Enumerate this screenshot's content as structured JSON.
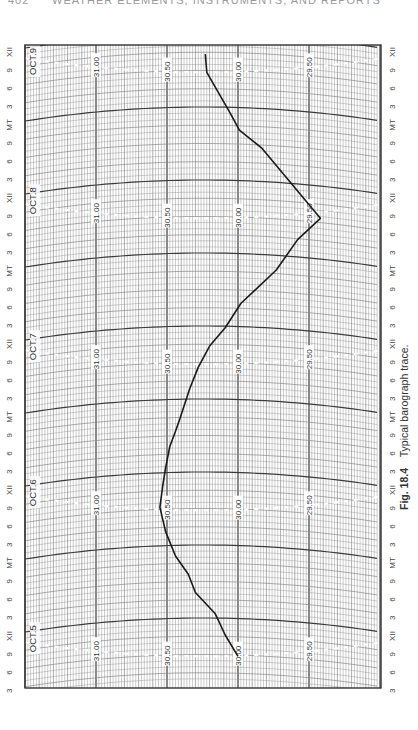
{
  "page": {
    "running_header": "WEATHER ELEMENTS, INSTRUMENTS, AND REPORTS",
    "page_number": "402"
  },
  "caption": {
    "figure": "Fig. 18.4",
    "text": "Typical barograph trace."
  },
  "chart_data": {
    "type": "line",
    "title": "Typical barograph trace",
    "orientation": "rotated 90° (time runs bottom-to-top, pressure decreases left-to-right)",
    "xlabel": "Time (3-hour ticks: 3, 6, 9, XII, 3, 6, 9, MT)",
    "ylabel": "Pressure (inches of mercury)",
    "pressure_ticks": [
      "31.00",
      "30.50",
      "30.00",
      "29.50"
    ],
    "pressure_range": [
      29.0,
      31.5
    ],
    "day_labels": [
      "OCT.5",
      "OCT.6",
      "OCT.7",
      "OCT.8",
      "OCT.9"
    ],
    "time_tick_labels_bottom_to_top": [
      "3",
      "6",
      "9",
      "XII",
      "3",
      "6",
      "9",
      "MT",
      "3",
      "6",
      "9",
      "XII",
      "3",
      "6",
      "9",
      "MT",
      "3",
      "6",
      "9",
      "XII",
      "3",
      "6",
      "9",
      "MT",
      "3",
      "6",
      "9",
      "XII",
      "3",
      "6",
      "9",
      "MT",
      "3",
      "6",
      "9",
      "XII"
    ],
    "grid": true,
    "series": [
      {
        "name": "Barometric pressure",
        "points": [
          {
            "time": "Oct 5 08:00",
            "value": 30.0
          },
          {
            "time": "Oct 5 11:30",
            "value": 30.09
          },
          {
            "time": "Oct 5 15:00",
            "value": 30.16
          },
          {
            "time": "Oct 5 18:30",
            "value": 30.3
          },
          {
            "time": "Oct 5 21:30",
            "value": 30.35
          },
          {
            "time": "Oct 6 00:30",
            "value": 30.44
          },
          {
            "time": "Oct 6 04:30",
            "value": 30.51
          },
          {
            "time": "Oct 6 08:30",
            "value": 30.55
          },
          {
            "time": "Oct 6 12:00",
            "value": 30.53
          },
          {
            "time": "Oct 6 15:00",
            "value": 30.51
          },
          {
            "time": "Oct 6 18:30",
            "value": 30.48
          },
          {
            "time": "Oct 6 21:00",
            "value": 30.44
          },
          {
            "time": "Oct 6 23:00",
            "value": 30.41
          },
          {
            "time": "Oct 7 04:00",
            "value": 30.34
          },
          {
            "time": "Oct 7 07:30",
            "value": 30.28
          },
          {
            "time": "Oct 7 11:00",
            "value": 30.2
          },
          {
            "time": "Oct 7 14:00",
            "value": 30.09
          },
          {
            "time": "Oct 7 18:00",
            "value": 29.98
          },
          {
            "time": "Oct 7 23:30",
            "value": 29.73
          },
          {
            "time": "Oct 8 04:30",
            "value": 29.58
          },
          {
            "time": "Oct 8 08:00",
            "value": 29.42
          },
          {
            "time": "Oct 8 10:30",
            "value": 29.51
          },
          {
            "time": "Oct 8 12:30",
            "value": 29.58
          },
          {
            "time": "Oct 8 19:30",
            "value": 29.83
          },
          {
            "time": "Oct 8 22:30",
            "value": 29.99
          },
          {
            "time": "Oct 9 01:30",
            "value": 30.06
          },
          {
            "time": "Oct 9 08:00",
            "value": 30.22
          },
          {
            "time": "Oct 9 11:00",
            "value": 30.23
          }
        ]
      }
    ]
  },
  "colors": {
    "grid_fine": "#8a8a8a",
    "grid_major": "#3a3a3a",
    "trace": "#1a1a1a",
    "dashed_day_line": "#ffffff"
  }
}
